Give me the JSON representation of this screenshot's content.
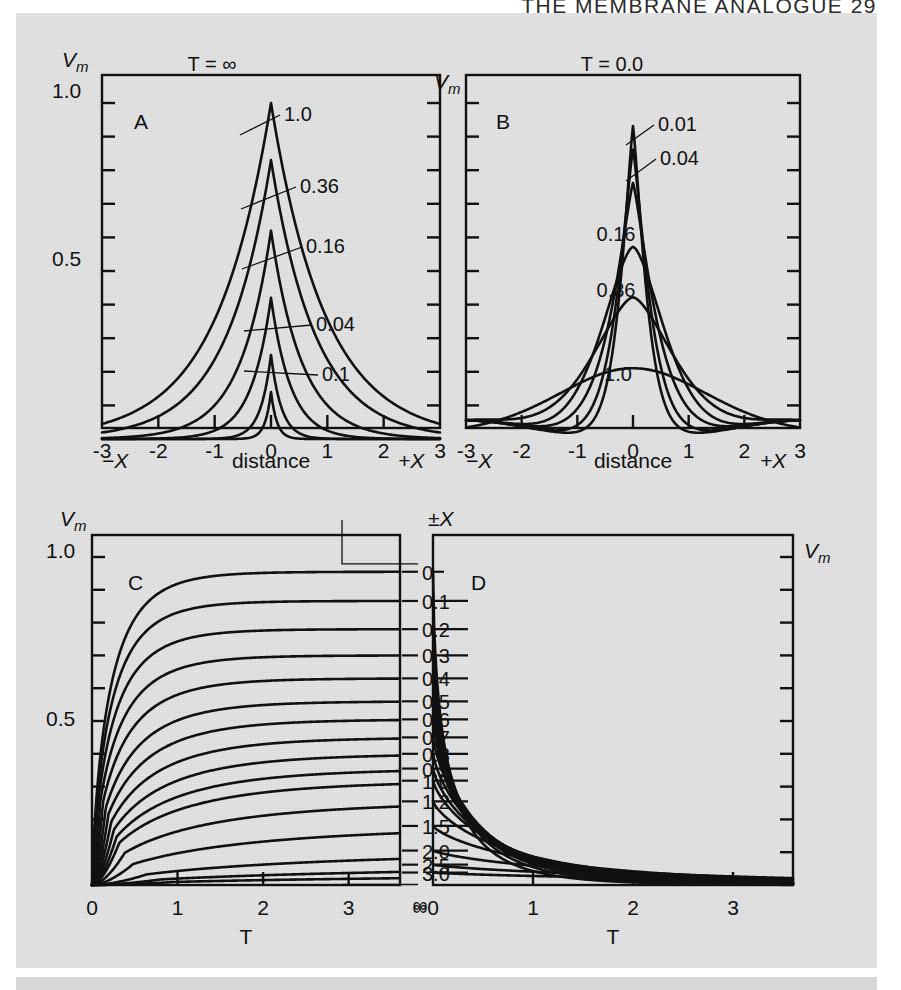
{
  "running_head": "THE MEMBRANE ANALOGUE   29",
  "colors": {
    "plate_background": "#d7d7d7",
    "ink": "#111111",
    "page": "#ffffff"
  },
  "panels": {
    "A": {
      "letter": "A",
      "y_axis_label": "Vm",
      "y_ticks": [
        "1.0",
        "0.5"
      ],
      "x_ticks": [
        "-3",
        "-2",
        "-1",
        "0",
        "1",
        "2",
        "3"
      ],
      "x_axis_label": "distance",
      "x_axis_left_label": "-X",
      "x_axis_right_label": "+X",
      "series_header": "T = ∞",
      "curve_labels": [
        "1.0",
        "0.36",
        "0.16",
        "0.04",
        "0.1"
      ]
    },
    "B": {
      "letter": "B",
      "y_axis_label": "Vm",
      "x_ticks": [
        "-3",
        "-2",
        "-1",
        "0",
        "1",
        "2",
        "3"
      ],
      "x_axis_label": "distance",
      "x_axis_left_label": "-X",
      "x_axis_right_label": "+X",
      "series_header": "T = 0.0",
      "curve_labels": [
        "0.01",
        "0.04",
        "0.16",
        "0.36",
        "1.0"
      ]
    },
    "C": {
      "letter": "C",
      "y_axis_label": "Vm",
      "y_ticks": [
        "1.0",
        "0.5"
      ],
      "x_ticks": [
        "0",
        "1",
        "2",
        "3"
      ],
      "x_tick_extra": "∞",
      "x_axis_label": "T"
    },
    "D": {
      "letter": "D",
      "y_axis_label": "Vm",
      "x_ticks": [
        "0",
        "1",
        "2",
        "3"
      ],
      "x_axis_label": "T"
    },
    "middle_column": {
      "header": "±X",
      "labels": [
        "0",
        "0.1",
        "0.2",
        "0.3",
        "0.4",
        "0.5",
        "0.6",
        "0.7",
        "0.8",
        "0.9",
        "1.0",
        "1.2",
        "1.5",
        "2.0",
        "2.5",
        "3.0"
      ],
      "footer": "∞"
    }
  },
  "chart_data": [
    {
      "id": "panel-A",
      "type": "line",
      "title": "A",
      "xlabel": "distance",
      "ylabel": "Vm",
      "xlim": [
        -3,
        3
      ],
      "ylim": [
        0,
        1.0
      ],
      "grid": false,
      "annotation": "T = ∞",
      "description": "Steady-state / decaying electrotonic potential Vm vs distance X for several values of T. Each curve peaks at X = 0 and decays symmetrically.",
      "series": [
        {
          "name": "∞",
          "peak": 1.0,
          "decay": 1.0
        },
        {
          "name": "1.0",
          "peak": 0.83,
          "decay": 0.82
        },
        {
          "name": "0.36",
          "peak": 0.62,
          "decay": 0.56
        },
        {
          "name": "0.16",
          "peak": 0.42,
          "decay": 0.36
        },
        {
          "name": "0.04",
          "peak": 0.25,
          "decay": 0.19
        },
        {
          "name": "0.1",
          "peak": 0.14,
          "decay": 0.105
        }
      ]
    },
    {
      "id": "panel-B",
      "type": "line",
      "title": "B",
      "xlabel": "distance",
      "ylabel": "Vm",
      "xlim": [
        -3,
        3
      ],
      "ylim": [
        0,
        1.0
      ],
      "grid": false,
      "annotation": "T = 0.0",
      "description": "Spread of charge with time; Vm vs distance X at successive times T. Peak at X = 0 falls and the profile broadens as T increases.",
      "series": [
        {
          "name": "0.0",
          "peak": 0.93,
          "width": 0.3
        },
        {
          "name": "0.01",
          "peak": 0.86,
          "width": 0.38
        },
        {
          "name": "0.04",
          "peak": 0.76,
          "width": 0.52
        },
        {
          "name": "0.16",
          "peak": 0.57,
          "width": 0.8
        },
        {
          "name": "0.36",
          "peak": 0.42,
          "width": 1.05
        },
        {
          "name": "1.0",
          "peak": 0.21,
          "width": 1.9
        }
      ]
    },
    {
      "id": "panel-C",
      "type": "line",
      "title": "C",
      "xlabel": "T",
      "ylabel": "Vm",
      "xlim": [
        0,
        3.6
      ],
      "ylim": [
        0,
        1.0
      ],
      "grid": false,
      "description": "Rise of Vm with time T at a family of distances ±X (0 to 3.0 and ∞). Each curve approaches a plateau equal to the steady-state value at that X.",
      "series": [
        {
          "name": "0",
          "plateau": 0.955
        },
        {
          "name": "0.1",
          "plateau": 0.866
        },
        {
          "name": "0.2",
          "plateau": 0.78
        },
        {
          "name": "0.3",
          "plateau": 0.7
        },
        {
          "name": "0.4",
          "plateau": 0.63
        },
        {
          "name": "0.5",
          "plateau": 0.56
        },
        {
          "name": "0.6",
          "plateau": 0.505
        },
        {
          "name": "0.7",
          "plateau": 0.45
        },
        {
          "name": "0.8",
          "plateau": 0.4
        },
        {
          "name": "0.9",
          "plateau": 0.355
        },
        {
          "name": "1.0",
          "plateau": 0.318
        },
        {
          "name": "1.2",
          "plateau": 0.255
        },
        {
          "name": "1.5",
          "plateau": 0.18
        },
        {
          "name": "2.0",
          "plateau": 0.105
        },
        {
          "name": "2.5",
          "plateau": 0.062
        },
        {
          "name": "3.0",
          "plateau": 0.038
        },
        {
          "name": "∞",
          "plateau": 0.0
        }
      ]
    },
    {
      "id": "panel-D",
      "type": "line",
      "title": "D",
      "xlabel": "T",
      "ylabel": "Vm",
      "xlim": [
        0,
        3.6
      ],
      "ylim": [
        0,
        1.0
      ],
      "grid": false,
      "description": "Decay of Vm with time T after the applied current is switched off, at the same family of distances ±X. All curves start from the steady-state value and fall toward zero.",
      "series": [
        {
          "name": "0",
          "start": 0.955
        },
        {
          "name": "0.1",
          "start": 0.866
        },
        {
          "name": "0.2",
          "start": 0.78
        },
        {
          "name": "0.3",
          "start": 0.7
        },
        {
          "name": "0.4",
          "start": 0.63
        },
        {
          "name": "0.5",
          "start": 0.56
        },
        {
          "name": "0.6",
          "start": 0.505
        },
        {
          "name": "0.7",
          "start": 0.45
        },
        {
          "name": "0.8",
          "start": 0.4
        },
        {
          "name": "0.9",
          "start": 0.355
        },
        {
          "name": "1.0",
          "start": 0.318
        },
        {
          "name": "1.2",
          "start": 0.255
        },
        {
          "name": "1.5",
          "start": 0.18
        },
        {
          "name": "2.0",
          "start": 0.105
        },
        {
          "name": "2.5",
          "start": 0.062
        },
        {
          "name": "3.0",
          "start": 0.038
        }
      ]
    }
  ]
}
